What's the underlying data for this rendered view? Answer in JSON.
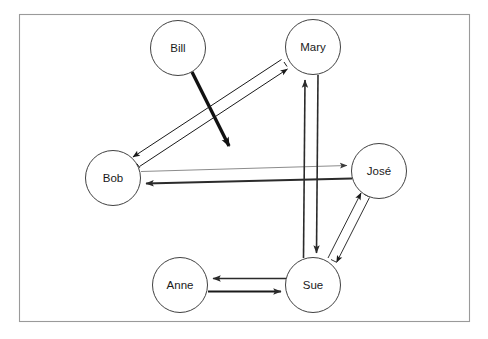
{
  "diagram": {
    "background_color": "#ffffff",
    "frame": {
      "name": "diagram-frame",
      "x": 19,
      "y": 14,
      "width": 451,
      "height": 308,
      "stroke_color": "#9a9a9a"
    },
    "node_style": {
      "fill": "#ffffff",
      "stroke": "#2b2b2b",
      "label_color": "#1a1a1a",
      "radius": 27.5
    },
    "nodes": [
      {
        "id": "bill",
        "label": "Bill",
        "cx": 178,
        "cy": 48,
        "r": 27.5
      },
      {
        "id": "mary",
        "label": "Mary",
        "cx": 313,
        "cy": 47,
        "r": 27.5
      },
      {
        "id": "bob",
        "label": "Bob",
        "cx": 113,
        "cy": 178,
        "r": 27.5
      },
      {
        "id": "jose",
        "label": "José",
        "cx": 379,
        "cy": 171,
        "r": 27.5
      },
      {
        "id": "sue",
        "label": "Sue",
        "cx": 313,
        "cy": 285,
        "r": 27.5
      },
      {
        "id": "anne",
        "label": "Anne",
        "cx": 180,
        "cy": 285,
        "r": 27.5
      }
    ],
    "edges": [
      {
        "id": "bill-out",
        "from": "Bill",
        "to": "",
        "style": "thick-solid",
        "direction": "one-way",
        "color": "#111111",
        "width": 3.4,
        "x1": 192,
        "y1": 72,
        "x2": 233,
        "y2": 150
      },
      {
        "id": "bob-mary",
        "from": "Bob",
        "to": "Mary",
        "style": "hollow-outline",
        "direction": "two-way",
        "color": "#1a1a1a",
        "width": 1.0,
        "x1": 133,
        "y1": 160,
        "x2": 291,
        "y2": 65
      },
      {
        "id": "bob-jose",
        "from": "Bob",
        "to": "José",
        "style": "thin-solid",
        "direction": "one-way",
        "color": "#8c8c8c",
        "width": 1.0,
        "x1": 141,
        "y1": 171,
        "x2": 352,
        "y2": 165
      },
      {
        "id": "jose-bob",
        "from": "José",
        "to": "Bob",
        "style": "medium-solid",
        "direction": "one-way",
        "color": "#2b2b2b",
        "width": 1.9,
        "x1": 352,
        "y1": 178,
        "x2": 141,
        "y2": 183
      },
      {
        "id": "sue-mary",
        "from": "Sue",
        "to": "Mary",
        "style": "medium-solid",
        "direction": "one-way",
        "color": "#2b2b2b",
        "width": 1.6,
        "x1": 303,
        "y1": 258,
        "x2": 305,
        "y2": 75
      },
      {
        "id": "mary-sue",
        "from": "Mary",
        "to": "Sue",
        "style": "medium-solid",
        "direction": "one-way",
        "color": "#2b2b2b",
        "width": 1.6,
        "x1": 318,
        "y1": 75,
        "x2": 316,
        "y2": 258
      },
      {
        "id": "jose-sue",
        "from": "José",
        "to": "Sue",
        "style": "hollow-outline",
        "direction": "two-way",
        "color": "#1a1a1a",
        "width": 0.9,
        "x1": 365,
        "y1": 195,
        "x2": 331,
        "y2": 262
      },
      {
        "id": "sue-anne",
        "from": "Sue",
        "to": "Anne",
        "style": "thin-solid",
        "direction": "one-way",
        "color": "#2b2b2b",
        "width": 1.3,
        "x1": 286,
        "y1": 278,
        "x2": 208,
        "y2": 278
      },
      {
        "id": "anne-sue",
        "from": "Anne",
        "to": "Sue",
        "style": "medium-solid",
        "direction": "one-way",
        "color": "#1a1a1a",
        "width": 2.2,
        "x1": 208,
        "y1": 291,
        "x2": 286,
        "y2": 291
      }
    ]
  }
}
